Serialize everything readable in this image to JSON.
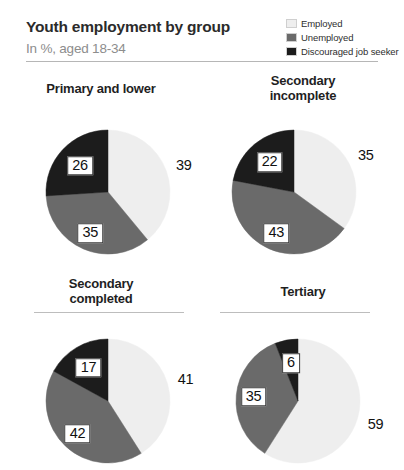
{
  "header": {
    "title": "Youth employment by group",
    "subtitle": "In %, aged 18-34"
  },
  "legend": {
    "items": [
      {
        "label": "Employed",
        "color": "#eeeeee"
      },
      {
        "label": "Unemployed",
        "color": "#6a6a6a"
      },
      {
        "label": "Discouraged job seeker",
        "color": "#1c1c1c"
      }
    ]
  },
  "chart_data": {
    "type": "pie",
    "title": "Youth employment by group",
    "subtitle": "In %, aged 18-34",
    "unit": "%",
    "legend_position": "top-right",
    "categories": [
      "Employed",
      "Unemployed",
      "Discouraged job seeker"
    ],
    "colors": [
      "#eeeeee",
      "#6a6a6a",
      "#1c1c1c"
    ],
    "panels": [
      {
        "title": "Primary and lower",
        "title_lines": [
          "Primary and lower"
        ],
        "values": [
          39,
          35,
          26
        ],
        "labels": [
          "39",
          "35",
          "26"
        ]
      },
      {
        "title": "Secondary incomplete",
        "title_lines": [
          "Secondary",
          "incomplete"
        ],
        "values": [
          35,
          43,
          22
        ],
        "labels": [
          "35",
          "43",
          "22"
        ]
      },
      {
        "title": "Secondary completed",
        "title_lines": [
          "Secondary",
          "completed"
        ],
        "values": [
          41,
          42,
          17
        ],
        "labels": [
          "41",
          "42",
          "17"
        ]
      },
      {
        "title": "Tertiary",
        "title_lines": [
          "Tertiary"
        ],
        "values": [
          59,
          35,
          6
        ],
        "labels": [
          "59",
          "35",
          "6"
        ]
      }
    ]
  }
}
